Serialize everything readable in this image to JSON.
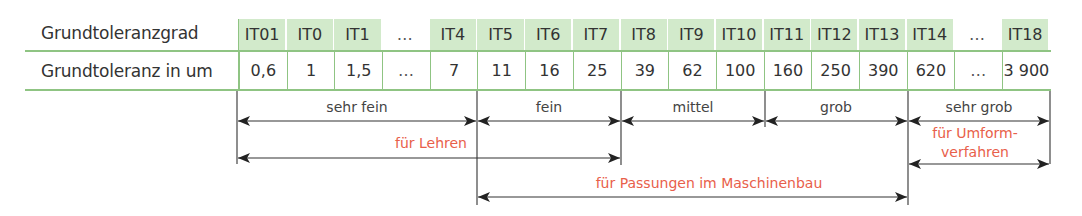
{
  "table": {
    "row_labels": {
      "grade": "Grundtoleranzgrad",
      "tolerance": "Grundtoleranz in um"
    },
    "columns": [
      {
        "grade": "IT01",
        "tolerance": "0,6",
        "highlight": true
      },
      {
        "grade": "IT0",
        "tolerance": "1",
        "highlight": true
      },
      {
        "grade": "IT1",
        "tolerance": "1,5",
        "highlight": true
      },
      {
        "grade": "…",
        "tolerance": "…",
        "highlight": false
      },
      {
        "grade": "IT4",
        "tolerance": "7",
        "highlight": true
      },
      {
        "grade": "IT5",
        "tolerance": "11",
        "highlight": true
      },
      {
        "grade": "IT6",
        "tolerance": "16",
        "highlight": true
      },
      {
        "grade": "IT7",
        "tolerance": "25",
        "highlight": true
      },
      {
        "grade": "IT8",
        "tolerance": "39",
        "highlight": true
      },
      {
        "grade": "IT9",
        "tolerance": "62",
        "highlight": true
      },
      {
        "grade": "IT10",
        "tolerance": "100",
        "highlight": true
      },
      {
        "grade": "IT11",
        "tolerance": "160",
        "highlight": true
      },
      {
        "grade": "IT12",
        "tolerance": "250",
        "highlight": true
      },
      {
        "grade": "IT13",
        "tolerance": "390",
        "highlight": true
      },
      {
        "grade": "IT14",
        "tolerance": "620",
        "highlight": true
      },
      {
        "grade": "…",
        "tolerance": "…",
        "highlight": false
      },
      {
        "grade": "IT18",
        "tolerance": "3 900",
        "highlight": true
      }
    ]
  },
  "ranges": {
    "quality": [
      {
        "label": "sehr fein",
        "from": "IT01",
        "to": "IT4"
      },
      {
        "label": "fein",
        "from": "IT5",
        "to": "IT7"
      },
      {
        "label": "mittel",
        "from": "IT8",
        "to": "IT10"
      },
      {
        "label": "grob",
        "from": "IT11",
        "to": "IT13"
      },
      {
        "label": "sehr grob",
        "from": "IT14",
        "to": "IT18"
      }
    ],
    "applications": [
      {
        "label": "für Lehren",
        "from": "IT01",
        "to": "IT7"
      },
      {
        "label_line1": "für Umform-",
        "label_line2": "verfahren",
        "from": "IT14",
        "to": "IT18"
      },
      {
        "label": "für Passungen im Maschinenbau",
        "from": "IT5",
        "to": "IT13"
      }
    ]
  },
  "colors": {
    "header_fill": "#d2eacb",
    "grid_line": "#8fc483",
    "text": "#333333",
    "application_text": "#e8604a",
    "arrow": "#222222"
  }
}
